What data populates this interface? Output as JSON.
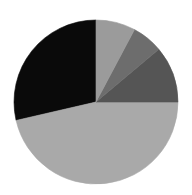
{
  "chart_data": {
    "type": "pie",
    "title": "",
    "subtitle": "",
    "xlabel": "",
    "ylabel": "",
    "grid": false,
    "legend": "none",
    "background_color": "#ffffff",
    "center_x": 96,
    "center_y": 102,
    "radius": 82,
    "start_angle_deg": 90,
    "direction": "counterclockwise",
    "categories": [
      "Slice 1",
      "Slice 2",
      "Slice 3",
      "Slice 4",
      "Slice 5"
    ],
    "values": [
      28.6,
      46.4,
      11.1,
      6.1,
      7.8
    ],
    "labels": [
      "",
      "",
      "",
      "",
      ""
    ],
    "colors": [
      "#0a0a0a",
      "#a9a9a9",
      "#9b9b9b",
      "#6d6d6d",
      "#555555"
    ],
    "slices": [
      {
        "name": "Slice 1",
        "value": 28.6,
        "percent": "28.6%",
        "color": "#0a0a0a",
        "start_deg": 90,
        "end_deg": 193
      },
      {
        "name": "Slice 2",
        "value": 46.4,
        "percent": "46.4%",
        "color": "#a9a9a9",
        "start_deg": 193,
        "end_deg": 360
      },
      {
        "name": "Slice 3",
        "value": 11.1,
        "percent": "11.1%",
        "color": "#555555",
        "start_deg": 0,
        "end_deg": 40
      },
      {
        "name": "Slice 4",
        "value": 6.1,
        "percent": "6.1%",
        "color": "#6d6d6d",
        "start_deg": 40,
        "end_deg": 62
      },
      {
        "name": "Slice 5",
        "value": 7.8,
        "percent": "7.8%",
        "color": "#9b9b9b",
        "start_deg": 62,
        "end_deg": 90
      }
    ]
  }
}
